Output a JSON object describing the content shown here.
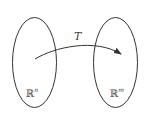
{
  "diagram": {
    "type": "mapping",
    "map_label": "T",
    "domain_set": {
      "label": "ℝ",
      "superscript": "n"
    },
    "codomain_set": {
      "label": "ℝ",
      "superscript": "m"
    },
    "colors": {
      "stroke": "#333333",
      "text": "#444444",
      "background": "#ffffff"
    }
  }
}
